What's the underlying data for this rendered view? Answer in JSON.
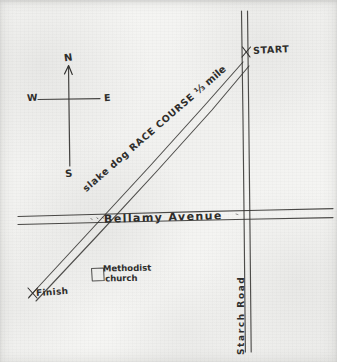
{
  "document": {
    "kind": "hand-drawn-map",
    "title": "Race Course Map"
  },
  "compass": {
    "north": "N",
    "south": "S",
    "west": "W",
    "east": "E"
  },
  "roads": [
    {
      "name": "Bellamy Avenue",
      "orientation": "horizontal",
      "label": "Bellamy Avenue"
    },
    {
      "name": "Starch Road",
      "orientation": "vertical",
      "label": "Starch Road"
    }
  ],
  "route": {
    "label": "slake dog RACE COURSE",
    "distance": "⅓ mile",
    "start_label": "START",
    "finish_label": "Finish",
    "start_marker": "x",
    "finish_marker": "x"
  },
  "landmarks": [
    {
      "name": "Methodist Church",
      "label_line1": "Methodist",
      "label_line2": "church",
      "symbol": "square"
    }
  ],
  "colors": {
    "ink": "#32312f",
    "paper": "#f4f4f2"
  }
}
